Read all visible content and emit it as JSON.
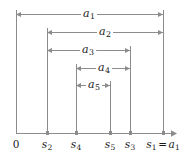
{
  "figure": {
    "width": 185,
    "height": 157,
    "background": "#ffffff",
    "line_color": "#8c8c8c",
    "axis_color": "#8c8c8c",
    "text_color": "#1a1a1a",
    "tick_color": "#8c8c8c"
  },
  "axis": {
    "name": "number-line",
    "y": 133,
    "x_start": 16,
    "x_end": 177,
    "arrowhead": "right"
  },
  "ticks": [
    {
      "id": "t0",
      "x": 16,
      "label": "0",
      "sub": "",
      "italic": false,
      "suffix": ""
    },
    {
      "id": "ts2",
      "x": 47,
      "label": "s",
      "sub": "2",
      "italic": true,
      "suffix": ""
    },
    {
      "id": "ts4",
      "x": 76,
      "label": "s",
      "sub": "4",
      "italic": true,
      "suffix": ""
    },
    {
      "id": "ts5",
      "x": 110,
      "label": "s",
      "sub": "5",
      "italic": true,
      "suffix": ""
    },
    {
      "id": "ts3",
      "x": 130,
      "label": "s",
      "sub": "3",
      "italic": true,
      "suffix": ""
    },
    {
      "id": "ts1",
      "x": 163,
      "label": "s",
      "sub": "1",
      "italic": true,
      "suffix": "= a"
    }
  ],
  "axis_labels": [
    {
      "text": "0",
      "x": 16,
      "y": 138
    },
    {
      "text": "s2",
      "x": 47,
      "y": 138
    },
    {
      "text": "s4",
      "x": 76,
      "y": 138
    },
    {
      "text": "s5",
      "x": 110,
      "y": 138
    },
    {
      "text": "s3",
      "x": 130,
      "y": 138
    },
    {
      "text": "s1 = a1",
      "x": 163,
      "y": 138
    }
  ],
  "measures": [
    {
      "id": "a1",
      "label": "a",
      "sub": "1",
      "x1": 16,
      "x2": 163,
      "y": 14,
      "label_x": 89,
      "left_tick": "0",
      "right_tick": "s1"
    },
    {
      "id": "a2",
      "label": "a",
      "sub": "2",
      "x1": 47,
      "x2": 163,
      "y": 32,
      "label_x": 105,
      "left_tick": "s2",
      "right_tick": "s1"
    },
    {
      "id": "a3",
      "label": "a",
      "sub": "3",
      "x1": 47,
      "x2": 130,
      "y": 50,
      "label_x": 88,
      "left_tick": "s2",
      "right_tick": "s3"
    },
    {
      "id": "a4",
      "label": "a",
      "sub": "4",
      "x1": 76,
      "x2": 130,
      "y": 68,
      "label_x": 104,
      "left_tick": "s4",
      "right_tick": "s3"
    },
    {
      "id": "a5",
      "label": "a",
      "sub": "5",
      "x1": 76,
      "x2": 110,
      "y": 85,
      "label_x": 94,
      "left_tick": "s4",
      "right_tick": "s5"
    }
  ],
  "verticals": [
    {
      "id": "v0",
      "x": 16,
      "y_top": 10,
      "y_bottom": 133
    },
    {
      "id": "vs2",
      "x": 47,
      "y_top": 28,
      "y_bottom": 133
    },
    {
      "id": "vs4",
      "x": 76,
      "y_top": 64,
      "y_bottom": 133
    },
    {
      "id": "vs5",
      "x": 110,
      "y_top": 81,
      "y_bottom": 133
    },
    {
      "id": "vs3",
      "x": 130,
      "y_top": 46,
      "y_bottom": 133
    },
    {
      "id": "vs1",
      "x": 163,
      "y_top": 10,
      "y_bottom": 133
    }
  ],
  "caption": ""
}
